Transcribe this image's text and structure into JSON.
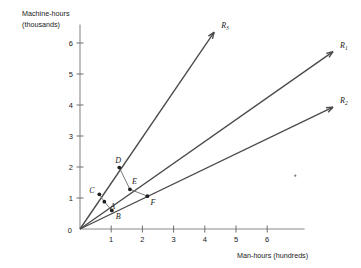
{
  "figure": {
    "axes": {
      "y_title_line1": "Machine-hours",
      "y_title_line2": "(thousands)",
      "x_title": "Man-hours (hundreds)",
      "origin_label": "0"
    }
  },
  "chart_data": {
    "type": "scatter",
    "title": "",
    "subtitle": "",
    "xlabel": "Man-hours (hundreds)",
    "ylabel": "Machine-hours (thousands)",
    "xlim": [
      0,
      7.2
    ],
    "ylim": [
      0,
      6.6
    ],
    "xticks": [
      1,
      2,
      3,
      4,
      5,
      6
    ],
    "yticks": [
      1,
      2,
      3,
      4,
      5,
      6
    ],
    "xtick_labels": [
      "1",
      "2",
      "3",
      "4",
      "5",
      "6"
    ],
    "ytick_labels": [
      "1",
      "2",
      "3",
      "4",
      "5",
      "6"
    ],
    "grid": false,
    "legend": "none",
    "origin": [
      0,
      0
    ],
    "rays": [
      {
        "name": "R_3",
        "label": "R",
        "subscript": "3",
        "slope": 1.6,
        "from": [
          0,
          0
        ],
        "to": [
          4.3,
          6.35
        ],
        "arrow": true
      },
      {
        "name": "R_1",
        "label": "R",
        "subscript": "1",
        "slope": 0.833,
        "from": [
          0,
          0
        ],
        "to": [
          8.15,
          5.75
        ],
        "arrow": true
      },
      {
        "name": "R_2",
        "label": "R",
        "subscript": "2",
        "slope": 0.55,
        "from": [
          0,
          0
        ],
        "to": [
          8.15,
          3.95
        ],
        "arrow": true
      }
    ],
    "points": [
      {
        "name": "A",
        "label": "A",
        "x": 0.78,
        "y": 0.88,
        "on_ray": "R_1",
        "label_dx": 6,
        "label_dy": 7
      },
      {
        "name": "B",
        "label": "B",
        "x": 1.02,
        "y": 0.6,
        "on_ray": "R_2",
        "label_dx": 4,
        "label_dy": 9
      },
      {
        "name": "C",
        "label": "C",
        "x": 0.62,
        "y": 1.12,
        "on_ray": "R_3",
        "label_dx": -10,
        "label_dy": -1
      },
      {
        "name": "D",
        "label": "D",
        "x": 1.26,
        "y": 1.98,
        "on_ray": "R_3",
        "label_dx": -4,
        "label_dy": -5
      },
      {
        "name": "E",
        "label": "E",
        "x": 1.6,
        "y": 1.28,
        "on_ray": "R_1",
        "label_dx": 2,
        "label_dy": -5
      },
      {
        "name": "F",
        "label": "F",
        "x": 2.16,
        "y": 1.06,
        "on_ray": "R_2",
        "label_dx": 3,
        "label_dy": 9
      }
    ],
    "connectors": [
      {
        "name": "C-A",
        "from": "C",
        "to": "A"
      },
      {
        "name": "A-B",
        "from": "A",
        "to": "B"
      },
      {
        "name": "D-E",
        "from": "D",
        "to": "E"
      },
      {
        "name": "E-F",
        "from": "E",
        "to": "F"
      }
    ],
    "specks": [
      {
        "name": "stray-mark",
        "x": 6.9,
        "y": 1.72
      }
    ]
  }
}
